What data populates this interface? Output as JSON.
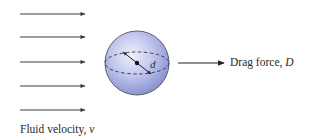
{
  "diagram": {
    "flow_arrows": {
      "count": 5,
      "x_start": 20,
      "x_end": 85,
      "y_positions": [
        14,
        37,
        62,
        86,
        110
      ],
      "color": "#3a3a3a"
    },
    "sphere": {
      "cx": 137,
      "cy": 63,
      "r": 32,
      "fill_light": "#e4e6f7",
      "fill_mid": "#aab0e3",
      "fill_dark": "#7d86cc",
      "stroke": "#555555",
      "diameter_label": "d"
    },
    "drag_arrow": {
      "x_start": 178,
      "x_end": 224,
      "y": 63,
      "color": "#2a2a2a"
    },
    "labels": {
      "fluid_velocity_text": "Fluid velocity, ",
      "fluid_velocity_var": "v",
      "drag_force_text": "Drag force, ",
      "drag_force_var": "D",
      "diameter": "d"
    }
  }
}
